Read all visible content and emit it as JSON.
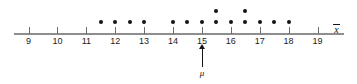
{
  "chart_data": {
    "type": "scatter",
    "plot_kind": "dotplot",
    "title": "",
    "subtitle": "",
    "xlabel": "x̄",
    "ylabel": "",
    "xlim": [
      8.6,
      19.4
    ],
    "ylim": [
      0,
      3
    ],
    "grid": false,
    "legend": null,
    "xticks": [
      9,
      10,
      11,
      12,
      13,
      14,
      15,
      16,
      17,
      18,
      19
    ],
    "xtick_labels": [
      "9",
      "10",
      "11",
      "12",
      "13",
      "14",
      "15",
      "16",
      "17",
      "18",
      "19"
    ],
    "dot_spacing": 0.5,
    "x": [
      11.5,
      12.0,
      12.5,
      13.0,
      14.0,
      14.5,
      15.0,
      15.5,
      15.5,
      16.0,
      16.5,
      16.5,
      17.0,
      17.5,
      18.0
    ],
    "stacks": [
      {
        "value": 11.5,
        "count": 1
      },
      {
        "value": 12.0,
        "count": 1
      },
      {
        "value": 12.5,
        "count": 1
      },
      {
        "value": 13.0,
        "count": 1
      },
      {
        "value": 14.0,
        "count": 1
      },
      {
        "value": 14.5,
        "count": 1
      },
      {
        "value": 15.0,
        "count": 1
      },
      {
        "value": 15.5,
        "count": 2
      },
      {
        "value": 16.0,
        "count": 1
      },
      {
        "value": 16.5,
        "count": 2
      },
      {
        "value": 17.0,
        "count": 1
      },
      {
        "value": 17.5,
        "count": 1
      },
      {
        "value": 18.0,
        "count": 1
      }
    ],
    "total_dots": 15,
    "annotations": [
      {
        "label": "μ",
        "x": 15,
        "type": "arrow-up-below-axis"
      }
    ],
    "colors": {
      "dot": "#121212",
      "axis": "#8e8e8e",
      "tick": "#6d6d6d",
      "text": "#1b1b1b",
      "annotation": "#141414",
      "background": "#ffffff"
    }
  },
  "axis": {
    "name": "x",
    "overbar": true
  },
  "annotation": {
    "mu_label": "μ"
  }
}
